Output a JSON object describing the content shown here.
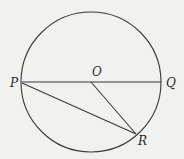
{
  "diagram": {
    "type": "circle-geometry",
    "background": "#f1f1ef",
    "stroke_color": "#3a3a3a",
    "circle": {
      "center": "O",
      "cx": 91,
      "cy": 82,
      "r": 70
    },
    "points": [
      {
        "name": "P",
        "x": 22,
        "y": 82
      },
      {
        "name": "Q",
        "x": 161,
        "y": 82
      },
      {
        "name": "O",
        "x": 91,
        "y": 82
      },
      {
        "name": "R",
        "x": 136,
        "y": 134
      }
    ],
    "segments": [
      {
        "from": "P",
        "to": "Q",
        "role": "diameter"
      },
      {
        "from": "P",
        "to": "R",
        "role": "chord"
      },
      {
        "from": "O",
        "to": "R",
        "role": "radius"
      }
    ],
    "labels": {
      "P": "P",
      "Q": "Q",
      "O": "O",
      "R": "R"
    }
  }
}
